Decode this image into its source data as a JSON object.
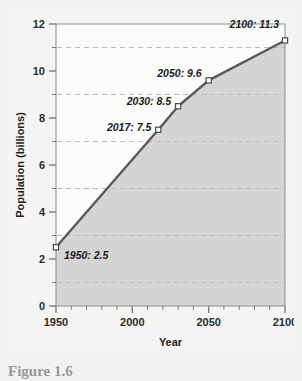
{
  "figure": {
    "caption": "Figure 1.6"
  },
  "chart_data": {
    "type": "area",
    "title": "",
    "xlabel": "Year",
    "ylabel": "Population (billions)",
    "xlim": [
      1950,
      2100
    ],
    "ylim": [
      0,
      12
    ],
    "x": [
      1950,
      2017,
      2030,
      2050,
      2100
    ],
    "values": [
      2.5,
      7.5,
      8.5,
      9.6,
      11.3
    ],
    "categories": [
      "1950",
      "2017",
      "2030",
      "2050",
      "2100"
    ],
    "series": [
      {
        "name": "World population",
        "values": [
          2.5,
          7.5,
          8.5,
          9.6,
          11.3
        ]
      }
    ],
    "xticks": [
      1950,
      2000,
      2050,
      2100
    ],
    "xtick_labels": [
      "1950",
      "2000",
      "2050",
      "2100"
    ],
    "xminor_step": 10,
    "yticks": [
      0,
      2,
      4,
      6,
      8,
      10,
      12
    ],
    "ytick_labels": [
      "0",
      "2",
      "4",
      "6",
      "8",
      "10",
      "12"
    ],
    "yminor_step": 1,
    "gridlines_y": [
      1,
      3,
      5,
      7,
      9,
      11
    ],
    "grid": "dashed-horizontal",
    "legend": "none",
    "annotations": [
      {
        "label": "1950: 2.5",
        "x": 1950,
        "y": 2.5,
        "anchor": "start",
        "dx": 8,
        "dy": 12
      },
      {
        "label": "2017: 7.5",
        "x": 2017,
        "y": 7.5,
        "anchor": "end",
        "dx": -7,
        "dy": 1
      },
      {
        "label": "2030: 8.5",
        "x": 2030,
        "y": 8.5,
        "anchor": "end",
        "dx": -7,
        "dy": -1
      },
      {
        "label": "2050: 9.6",
        "x": 2050,
        "y": 9.6,
        "anchor": "end",
        "dx": -7,
        "dy": -3
      },
      {
        "label": "2100: 11.3",
        "x": 2100,
        "y": 11.3,
        "anchor": "end",
        "dx": -6,
        "dy": -12
      }
    ],
    "colors": {
      "line": "#595959",
      "area_fill": "#d4d4d2",
      "plot_background": "#fbfbfa",
      "gridline": "#b9b9b7",
      "axis": "#7d7d7b",
      "marker_fill": "#ffffff",
      "marker_stroke": "#4a4a4a",
      "page_background": "#f2f2f0",
      "caption_text": "#9a9a98"
    }
  }
}
